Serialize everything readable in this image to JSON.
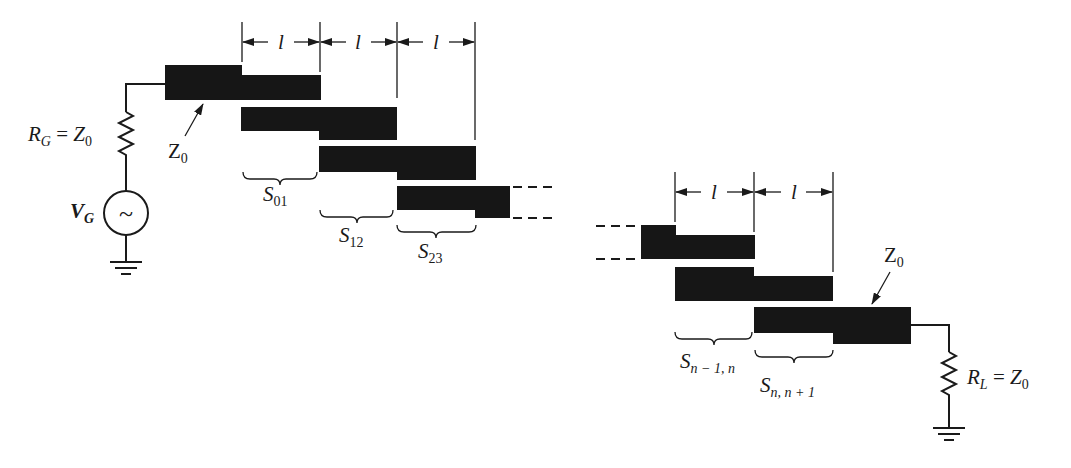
{
  "diagram": {
    "type": "coupled-line bandpass filter layout (microstrip)",
    "colors": {
      "ink": "#161616",
      "background": "#ffffff"
    },
    "source": {
      "resistor_label": {
        "main": "R",
        "sub": "G",
        "eq": " = ",
        "rhs": "Z",
        "rhs_sub": "0"
      },
      "generator_label": {
        "main": "V",
        "sub": "G"
      },
      "generator_symbol": "~",
      "ground": "ground-symbol"
    },
    "input_line_label": {
      "main": "Z",
      "sub": "0"
    },
    "output_line_label": {
      "main": "Z",
      "sub": "0"
    },
    "load": {
      "resistor_label": {
        "main": "R",
        "sub": "L",
        "eq": " = ",
        "rhs": "Z",
        "rhs_sub": "0"
      },
      "ground": "ground-symbol"
    },
    "length_label": "l",
    "length_dimensions_left": [
      "l",
      "l",
      "l"
    ],
    "length_dimensions_right": [
      "l",
      "l"
    ],
    "spacings": [
      {
        "main": "S",
        "sub": "01"
      },
      {
        "main": "S",
        "sub": "12"
      },
      {
        "main": "S",
        "sub": "23"
      },
      {
        "main": "S",
        "sub": "n − 1, n"
      },
      {
        "main": "S",
        "sub": "n, n + 1"
      }
    ]
  }
}
